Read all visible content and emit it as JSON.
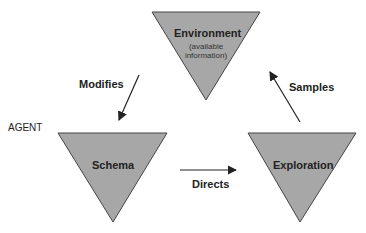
{
  "title": "",
  "nodes": {
    "environment": {
      "label": "Environment",
      "sub1": "(available",
      "sub2": "information)"
    },
    "schema": {
      "label": "Schema"
    },
    "exploration": {
      "label": "Exploration"
    }
  },
  "edges": {
    "modifies": "Modifies",
    "directs": "Directs",
    "samples": "Samples"
  },
  "agent_label": "AGENT",
  "colors": {
    "fill": "#a7a7a7",
    "stroke": "#444444",
    "arrow": "#222222"
  }
}
